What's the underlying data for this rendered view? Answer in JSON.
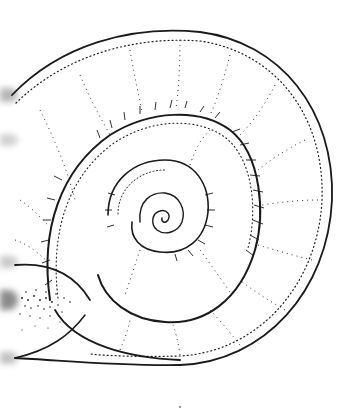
{
  "figure": {
    "subject": "planispiral snail shell illustration",
    "style": "pen-and-ink stipple drawing",
    "colors": {
      "background": "#ffffff",
      "ink": "#1a1a1a",
      "smudge": "#9a9a9a"
    },
    "icons": {
      "shell": "shell-spiral-icon"
    },
    "edge_smudges_y": [
      95,
      140,
      262,
      300,
      358
    ]
  }
}
